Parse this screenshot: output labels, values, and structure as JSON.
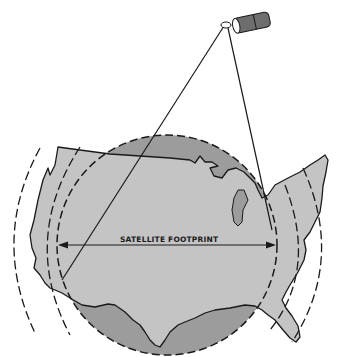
{
  "diagram": {
    "label": "SATELLITE FOOTPRINT",
    "colors": {
      "background": "#ffffff",
      "footprint_disc": "#9c9c9c",
      "land": "#c4c4c4",
      "outline": "#1a1a1a",
      "satellite_body": "#6e6e6e"
    },
    "elements": {
      "satellite": "satellite-icon",
      "beam_lines": 2,
      "footprint_circle": "dashed",
      "outer_arcs": 4,
      "map": "continental-united-states"
    }
  }
}
